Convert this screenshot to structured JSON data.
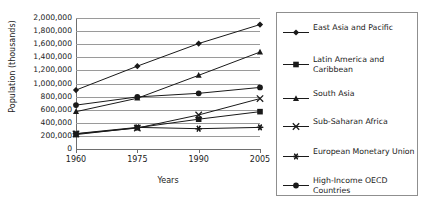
{
  "chart_data": {
    "type": "line",
    "title": "",
    "xlabel": "Years",
    "ylabel": "Population (thousands)",
    "categories": [
      "1960",
      "1975",
      "1990",
      "2005"
    ],
    "x": [
      1960,
      1975,
      1990,
      2005
    ],
    "ylim": [
      0,
      2000000
    ],
    "xlim": [
      1960,
      2005
    ],
    "y_tick_labels": [
      "2,000,000",
      "1,800,000",
      "1,600,000",
      "1,400,000",
      "1,200,000",
      "1,000,000",
      "800,000",
      "600,000",
      "400,000",
      "200,000",
      "0"
    ],
    "y_tick_values": [
      2000000,
      1800000,
      1600000,
      1400000,
      1200000,
      1000000,
      800000,
      600000,
      400000,
      200000,
      0
    ],
    "grid": "horizontal",
    "legend_position": "right",
    "line_color": "#1a1a1a",
    "grid_color": "#9a9a9a",
    "series": [
      {
        "name": "East Asia and Pacific",
        "marker": "diamond",
        "values": [
          900000,
          1265000,
          1610000,
          1900000
        ]
      },
      {
        "name": "Latin America and Caribbean",
        "marker": "square",
        "values": [
          220000,
          325000,
          455000,
          570000
        ]
      },
      {
        "name": "South Asia",
        "marker": "triangle",
        "values": [
          570000,
          775000,
          1125000,
          1480000
        ]
      },
      {
        "name": "Sub-Saharan Africa",
        "marker": "cross",
        "values": [
          230000,
          320000,
          520000,
          770000
        ]
      },
      {
        "name": "European Monetary Union",
        "marker": "asterisk",
        "values": [
          235000,
          330000,
          310000,
          330000
        ]
      },
      {
        "name": "High-Income OECD Countries",
        "marker": "circle",
        "values": [
          670000,
          795000,
          850000,
          940000
        ]
      }
    ]
  },
  "legend": {
    "items": [
      {
        "label": "East Asia and Pacific",
        "marker": "diamond"
      },
      {
        "label": "Latin America and Caribbean",
        "marker": "square"
      },
      {
        "label": "South Asia",
        "marker": "triangle"
      },
      {
        "label": "Sub-Saharan Africa",
        "marker": "cross"
      },
      {
        "label": "European Monetary Union",
        "marker": "asterisk"
      },
      {
        "label": "High-Income OECD Countries",
        "marker": "circle"
      }
    ]
  }
}
